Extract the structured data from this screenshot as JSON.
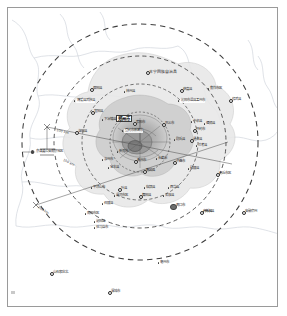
{
  "figure": {
    "kind": "radial-distance-map",
    "center_label": "郑州市",
    "border_color": "#9a9a9a",
    "ring_color": "#3d3d3d",
    "boundary_color": "#c9cfd6",
    "urban_fill": "#a9a9a9",
    "suburban_fill": "#c7c7c7",
    "outer_fill": "#e2e2e2"
  },
  "rings": [
    {
      "label": "50 km",
      "radius_px": 30
    },
    {
      "label": "100 km",
      "radius_px": 58
    },
    {
      "label": "150 km",
      "radius_px": 86
    },
    {
      "label": "200 km",
      "radius_px": 118
    }
  ],
  "distance_annotations": [
    {
      "text": "100 km",
      "x": 57,
      "y": 128,
      "angle": 14
    },
    {
      "text": "150 km",
      "x": 64,
      "y": 158,
      "angle": 26
    },
    {
      "text": "200 km",
      "x": 39,
      "y": 205,
      "angle": 32
    }
  ],
  "core": {
    "label": "郑州市",
    "x": 127,
    "y": 143
  },
  "labels": [
    {
      "text": "本宁回族自治县",
      "x": 149,
      "y": 72,
      "cls": "mid",
      "marker": "ring"
    },
    {
      "text": "原阳县",
      "x": 93,
      "y": 89,
      "cls": "",
      "marker": "ring"
    },
    {
      "text": "林州县",
      "x": 126,
      "y": 92,
      "cls": "",
      "marker": "dot"
    },
    {
      "text": "获嘉县",
      "x": 183,
      "y": 90,
      "cls": "",
      "marker": "ring"
    },
    {
      "text": "焦作市区",
      "x": 210,
      "y": 89,
      "cls": "",
      "marker": "dot"
    },
    {
      "text": "修武县",
      "x": 232,
      "y": 100,
      "cls": "",
      "marker": "ring"
    },
    {
      "text": "博爱县武陟县",
      "x": 76,
      "y": 101,
      "cls": "plate",
      "marker": "dot"
    },
    {
      "text": "沁阳市温县孟州市",
      "x": 180,
      "y": 101,
      "cls": "plate",
      "marker": "dot"
    },
    {
      "text": "宜阳县",
      "x": 94,
      "y": 112,
      "cls": "",
      "marker": "ring"
    },
    {
      "text": "下冶镇县",
      "x": 104,
      "y": 120,
      "cls": "",
      "marker": "dot"
    },
    {
      "text": "荥阳市",
      "x": 136,
      "y": 123,
      "cls": "",
      "marker": "ring"
    },
    {
      "text": "巩义市",
      "x": 165,
      "y": 124,
      "cls": "",
      "marker": "ring"
    },
    {
      "text": "中牟县",
      "x": 193,
      "y": 122,
      "cls": "",
      "marker": "dot"
    },
    {
      "text": "洛阳县",
      "x": 78,
      "y": 132,
      "cls": "",
      "marker": "ring"
    },
    {
      "text": "登封市新密市",
      "x": 124,
      "y": 131,
      "cls": "plate",
      "marker": "dot"
    },
    {
      "text": "开封市",
      "x": 196,
      "y": 130,
      "cls": "",
      "marker": "ring"
    },
    {
      "text": "偃师县",
      "x": 206,
      "y": 124,
      "cls": "",
      "marker": "dot"
    },
    {
      "text": "尉氏县",
      "x": 176,
      "y": 140,
      "cls": "",
      "marker": "dot"
    },
    {
      "text": "通许县",
      "x": 193,
      "y": 140,
      "cls": "",
      "marker": "ring"
    },
    {
      "text": "兰考县",
      "x": 198,
      "y": 146,
      "cls": "",
      "marker": "dot"
    },
    {
      "text": "京津冀公安南京地区",
      "x": 35,
      "y": 152,
      "cls": "plate",
      "marker": "star"
    },
    {
      "text": "新郑市",
      "x": 119,
      "y": 152,
      "cls": "",
      "marker": "dot"
    },
    {
      "text": "汝州市",
      "x": 104,
      "y": 160,
      "cls": "",
      "marker": "dot"
    },
    {
      "text": "禹州市",
      "x": 137,
      "y": 161,
      "cls": "",
      "marker": "ring"
    },
    {
      "text": "长葛市",
      "x": 158,
      "y": 159,
      "cls": "",
      "marker": "dot"
    },
    {
      "text": "许昌市",
      "x": 176,
      "y": 162,
      "cls": "",
      "marker": "ring"
    },
    {
      "text": "宝丰县",
      "x": 110,
      "y": 168,
      "cls": "",
      "marker": "dot"
    },
    {
      "text": "襄城县",
      "x": 146,
      "y": 171,
      "cls": "",
      "marker": "ring"
    },
    {
      "text": "鄢陵县",
      "x": 190,
      "y": 169,
      "cls": "",
      "marker": "dot"
    },
    {
      "text": "平顶山市",
      "x": 93,
      "y": 188,
      "cls": "",
      "marker": "dot"
    },
    {
      "text": "叶县",
      "x": 121,
      "y": 189,
      "cls": "",
      "marker": "ring"
    },
    {
      "text": "临颍县",
      "x": 146,
      "y": 188,
      "cls": "",
      "marker": "dot"
    },
    {
      "text": "西华县",
      "x": 170,
      "y": 188,
      "cls": "",
      "marker": "dot"
    },
    {
      "text": "漯河市区",
      "x": 116,
      "y": 196,
      "cls": "",
      "marker": "dot"
    },
    {
      "text": "舞阳县",
      "x": 142,
      "y": 196,
      "cls": "",
      "marker": "ring"
    },
    {
      "text": "太康县",
      "x": 165,
      "y": 196,
      "cls": "",
      "marker": "dot"
    },
    {
      "text": "召陵县",
      "x": 104,
      "y": 204,
      "cls": "",
      "marker": "dot"
    },
    {
      "text": "周口市",
      "x": 176,
      "y": 206,
      "cls": "",
      "marker": "big"
    },
    {
      "text": "商水县",
      "x": 205,
      "y": 212,
      "cls": "",
      "marker": "dot"
    },
    {
      "text": "南阳市区",
      "x": 87,
      "y": 214,
      "cls": "",
      "marker": "dot"
    },
    {
      "text": "泌阳县",
      "x": 96,
      "y": 222,
      "cls": "",
      "marker": "dot"
    },
    {
      "text": "驻马店市",
      "x": 96,
      "y": 228,
      "cls": "",
      "marker": "dot"
    },
    {
      "text": "商丘市区",
      "x": 219,
      "y": 174,
      "cls": "",
      "marker": "ring"
    },
    {
      "text": "商丘县",
      "x": 203,
      "y": 212,
      "cls": "",
      "marker": "ring"
    },
    {
      "text": "安徽宿州",
      "x": 245,
      "y": 212,
      "cls": "",
      "marker": "ring"
    },
    {
      "text": "亳州市",
      "x": 160,
      "y": 263,
      "cls": "",
      "marker": "dot"
    },
    {
      "text": "山石家庄北",
      "x": 53,
      "y": 273,
      "cls": "",
      "marker": "ring"
    },
    {
      "text": "漯城市",
      "x": 111,
      "y": 292,
      "cls": "",
      "marker": "ring"
    }
  ],
  "corner_mark": {
    "present": true
  }
}
